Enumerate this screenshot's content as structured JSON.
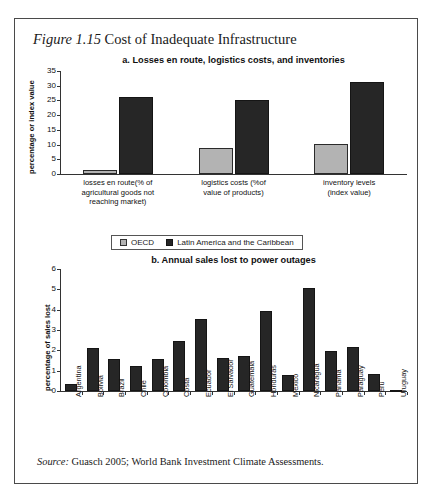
{
  "figure": {
    "number": "Figure 1.15",
    "title": "Cost of Inadequate Infrastructure",
    "source_prefix": "Source:",
    "source_text": "Guasch 2005; World Bank Investment Climate Assessments."
  },
  "legend": {
    "oecd_label": "OECD",
    "lac_label": "Latin America and the Caribbean",
    "oecd_color": "#b3b3b3",
    "lac_color": "#262626"
  },
  "chart_data": [
    {
      "type": "bar",
      "id": "panel-a",
      "title": "a. Losses en route, logistics costs, and inventories",
      "xlabel": "",
      "ylabel": "percentage or index value",
      "ylim": [
        0,
        35
      ],
      "yticks": [
        0,
        5,
        10,
        15,
        20,
        25,
        30,
        35
      ],
      "grid": false,
      "legend_position": "bottom",
      "categories": [
        "losses en route(% of agricultural goods not reaching market)",
        "logistics costs (%of value of products)",
        "inventory levels (index value)"
      ],
      "category_lines": [
        [
          "losses en route(% of",
          "agricultural goods not",
          "reaching market)"
        ],
        [
          "logistics costs (%of",
          "value of products)"
        ],
        [
          "inventory levels",
          "(index value)"
        ]
      ],
      "series": [
        {
          "name": "OECD",
          "color": "#b3b3b3",
          "values": [
            1.2,
            8.7,
            10.3
          ]
        },
        {
          "name": "Latin America and the Caribbean",
          "color": "#262626",
          "values": [
            26.0,
            25.2,
            31.1
          ]
        }
      ]
    },
    {
      "type": "bar",
      "id": "panel-b",
      "title": "b. Annual sales lost to power outages",
      "xlabel": "",
      "ylabel": "percentage of sales lost",
      "ylim": [
        0,
        6
      ],
      "yticks": [
        0,
        1,
        2,
        3,
        4,
        5,
        6
      ],
      "grid": false,
      "legend_position": "none",
      "categories": [
        "Argentina",
        "Bolivia",
        "Brazil",
        "Chile",
        "Colombia",
        "Costa",
        "Ecuador",
        "El Salvador",
        "Guatemala",
        "Honduras",
        "Mexico",
        "Nicaragua",
        "Panama",
        "Paraguay",
        "Peru",
        "Uruguay"
      ],
      "series": [
        {
          "name": "annual sales lost",
          "color": "#262626",
          "values": [
            0.32,
            2.12,
            1.55,
            1.25,
            1.57,
            2.45,
            3.55,
            1.62,
            1.72,
            3.92,
            0.78,
            5.08,
            1.95,
            2.15,
            0.82,
            0.07
          ]
        }
      ]
    }
  ]
}
